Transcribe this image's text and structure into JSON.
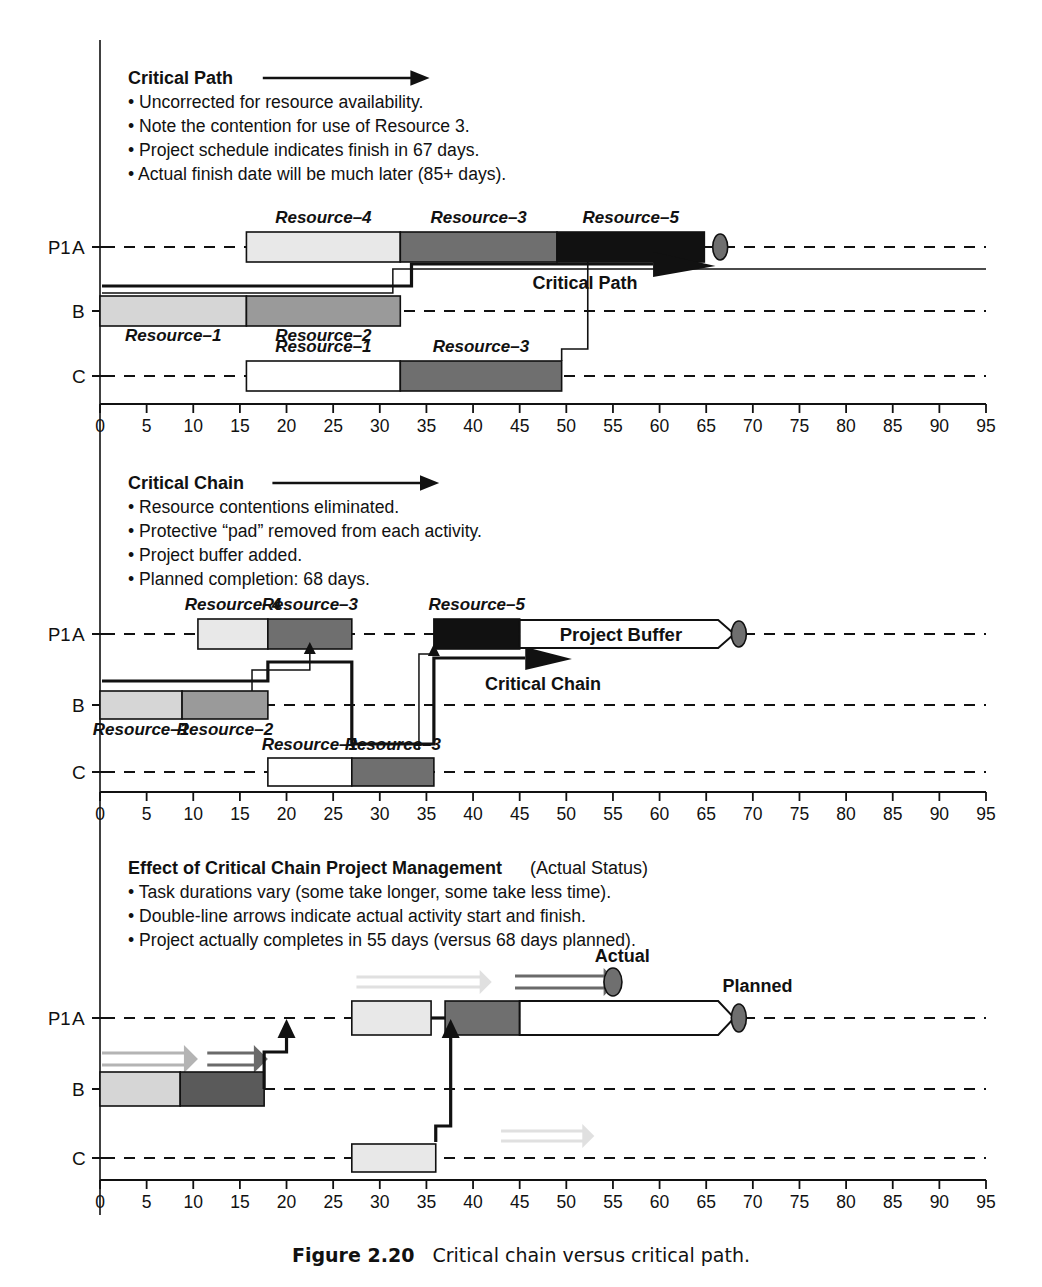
{
  "figure": {
    "number": "Figure 2.20",
    "caption": "Critical chain versus critical path."
  },
  "axis": {
    "ticks": [
      0,
      5,
      10,
      15,
      20,
      25,
      30,
      35,
      40,
      45,
      50,
      55,
      60,
      65,
      70,
      75,
      80,
      85,
      90,
      95
    ],
    "min": 0,
    "max": 95,
    "step": 5
  },
  "rows": {
    "project_label": "P1",
    "a": "A",
    "b": "B",
    "c": "C"
  },
  "panels": [
    {
      "id": "critical-path",
      "title": "Critical Path",
      "bullets": [
        "Uncorrected for resource availability.",
        "Note the contention for use of Resource 3.",
        "Project schedule indicates finish in 67 days.",
        "Actual finish date will be much later (85+ days)."
      ],
      "annotations": [
        {
          "name": "critical-path-arrow-label",
          "text": "Critical Path"
        }
      ],
      "bars": {
        "A": [
          {
            "label": "Resource–4",
            "start": 15.7,
            "end": 32.2,
            "fill": "#e8e8e8"
          },
          {
            "label": "Resource–3",
            "start": 32.2,
            "end": 49.0,
            "fill": "#6f6f6f"
          },
          {
            "label": "Resource–5",
            "start": 49.0,
            "end": 64.8,
            "fill": "#111111"
          }
        ],
        "B": [
          {
            "label": "Resource–1",
            "start": 0.0,
            "end": 15.7,
            "fill": "#d6d6d6"
          },
          {
            "label": "Resource–2",
            "start": 15.7,
            "end": 32.2,
            "fill": "#9a9a9a"
          }
        ],
        "C": [
          {
            "label": "Resource–1",
            "start": 15.7,
            "end": 32.2,
            "fill": "#ffffff"
          },
          {
            "label": "Resource–3",
            "start": 32.2,
            "end": 49.5,
            "fill": "#6f6f6f"
          }
        ]
      },
      "milestone": {
        "day": 66.5,
        "name": "planned-finish-marker"
      }
    },
    {
      "id": "critical-chain",
      "title": "Critical Chain",
      "bullets": [
        "Resource contentions eliminated.",
        "Protective “pad” removed from each activity.",
        "Project buffer added.",
        "Planned completion: 68 days."
      ],
      "annotations": [
        {
          "name": "critical-chain-arrow-label",
          "text": "Critical Chain"
        },
        {
          "name": "project-buffer-label",
          "text": "Project Buffer"
        }
      ],
      "bars": {
        "A": [
          {
            "label": "Resource–4",
            "start": 10.5,
            "end": 18.0,
            "fill": "#e8e8e8"
          },
          {
            "label": "Resource–3",
            "start": 18.0,
            "end": 27.0,
            "fill": "#6f6f6f"
          },
          {
            "label": "Resource–5",
            "start": 35.8,
            "end": 45.0,
            "fill": "#111111"
          }
        ],
        "B": [
          {
            "label": "Resource–1",
            "start": 0.0,
            "end": 8.8,
            "fill": "#d6d6d6"
          },
          {
            "label": "Resource–2",
            "start": 8.8,
            "end": 18.0,
            "fill": "#9a9a9a"
          }
        ],
        "C": [
          {
            "label": "Resource–1",
            "start": 18.0,
            "end": 27.0,
            "fill": "#ffffff"
          },
          {
            "label": "Resource–3",
            "start": 27.0,
            "end": 35.8,
            "fill": "#6f6f6f"
          }
        ]
      },
      "buffer": {
        "start": 45.0,
        "end": 68.0
      },
      "milestone": {
        "day": 68.5,
        "name": "planned-finish-marker"
      }
    },
    {
      "id": "effect-of-ccpm",
      "title": "Effect of Critical Chain Project Management",
      "title_suffix": " (Actual Status)",
      "bullets": [
        "Task durations vary (some take longer, some take less time).",
        "Double-line arrows indicate actual activity start and finish.",
        "Project actually completes in 55 days (versus 68 days planned)."
      ],
      "annotations": [
        {
          "name": "actual-label",
          "text": "Actual"
        },
        {
          "name": "planned-label",
          "text": "Planned"
        }
      ],
      "bars": {
        "A": [
          {
            "label": "",
            "start": 27.0,
            "end": 35.5,
            "fill": "#e8e8e8"
          },
          {
            "label": "",
            "start": 37.0,
            "end": 45.0,
            "fill": "#6f6f6f"
          }
        ],
        "B": [
          {
            "label": "",
            "start": 0.0,
            "end": 8.6,
            "fill": "#d6d6d6"
          },
          {
            "label": "",
            "start": 8.6,
            "end": 17.6,
            "fill": "#5a5a5a"
          }
        ],
        "C": [
          {
            "label": "",
            "start": 27.0,
            "end": 36.0,
            "fill": "#e8e8e8"
          }
        ]
      },
      "buffer": {
        "start": 45.0,
        "end": 68.0
      },
      "actual_marker": {
        "day": 55.0
      },
      "milestone": {
        "day": 68.5,
        "name": "planned-finish-marker"
      }
    }
  ]
}
